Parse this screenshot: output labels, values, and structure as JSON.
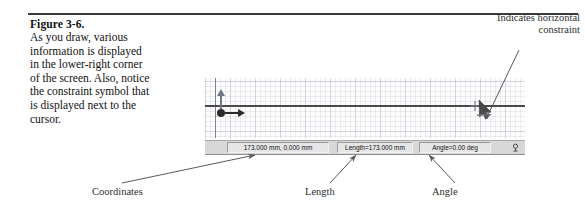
{
  "figure": {
    "title": "Figure 3-6.",
    "body": "As you draw, various information is displayed in the lower-right corner of the screen. Also, notice the constraint symbol that is displayed next to the cursor."
  },
  "annotations": {
    "constraint": "Indicates horizontal constraint",
    "coordinates": "Coordinates",
    "length": "Length",
    "angle": "Angle"
  },
  "cad": {
    "statusbar": {
      "coordinates": "173.000 mm, 0.000 mm",
      "length": "Length=173.000 mm",
      "angle": "Angle=0.00 deg",
      "icon": "snap-indicator-icon"
    },
    "canvas": {
      "origin_icon": "origin-point-icon",
      "x_axis_icon": "x-axis-arrow-icon",
      "y_axis_icon": "y-axis-arrow-icon",
      "cursor_icon": "crosshair-cursor-icon",
      "constraint_icon": "horizontal-constraint-icon",
      "line_icon": "drawn-line-icon"
    }
  },
  "colors": {
    "rule": "#3a3a3a",
    "line": "#4a4a4a",
    "grid": "#96a0af",
    "statusbar_bg": "#d8d8d8",
    "text": "#111111",
    "leader": "#6b6b6b"
  }
}
